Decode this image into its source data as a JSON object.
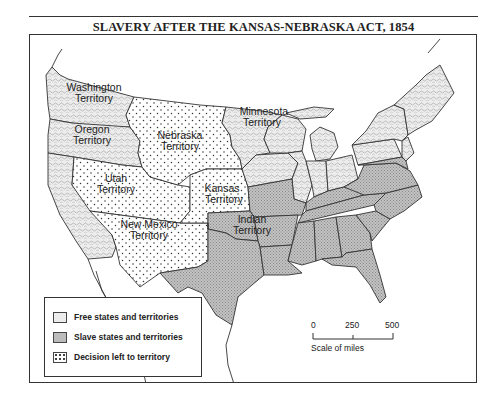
{
  "title": "SLAVERY AFTER THE KANSAS-NEBRASKA ACT, 1854",
  "colors": {
    "free_fill": "#e9e9e9",
    "slave_fill": "#b9b9b9",
    "decision_fill": "#ffffff",
    "border": "#333333",
    "water": "#ffffff"
  },
  "territory_labels": {
    "washington": [
      "Washington",
      "Territory"
    ],
    "oregon": [
      "Oregon",
      "Territory"
    ],
    "nebraska": [
      "Nebraska",
      "Territory"
    ],
    "minnesota": [
      "Minnesota",
      "Territory"
    ],
    "utah": [
      "Utah",
      "Territory"
    ],
    "kansas": [
      "Kansas",
      "Territory"
    ],
    "new_mexico": [
      "New Mexico",
      "Territory"
    ],
    "indian": [
      "Indian",
      "Territory"
    ]
  },
  "legend": {
    "items": [
      {
        "pattern": "free",
        "label": "Free states and territories"
      },
      {
        "pattern": "slave",
        "label": "Slave states and territories"
      },
      {
        "pattern": "decision",
        "label": "Decision left to territory"
      }
    ]
  },
  "scale": {
    "ticks": [
      "0",
      "250",
      "500"
    ],
    "label": "Scale of miles"
  }
}
